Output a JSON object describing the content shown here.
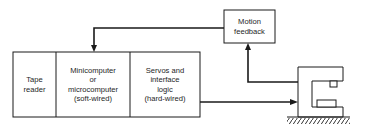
{
  "diagram": {
    "blocks": [
      {
        "id": "tape-reader",
        "lines": [
          "Tape",
          "reader"
        ]
      },
      {
        "id": "computer",
        "lines": [
          "Minicomputer",
          "or",
          "microcomputer",
          "(soft-wired)"
        ]
      },
      {
        "id": "servos",
        "lines": [
          "Servos and",
          "interface",
          "logic",
          "(hard-wired)"
        ]
      }
    ],
    "feedback": {
      "lines": [
        "Motion",
        "feedback"
      ]
    },
    "machine": {
      "label": "machine-tool"
    },
    "colors": {
      "line": "#1a1a1a",
      "background": "#ffffff"
    }
  }
}
